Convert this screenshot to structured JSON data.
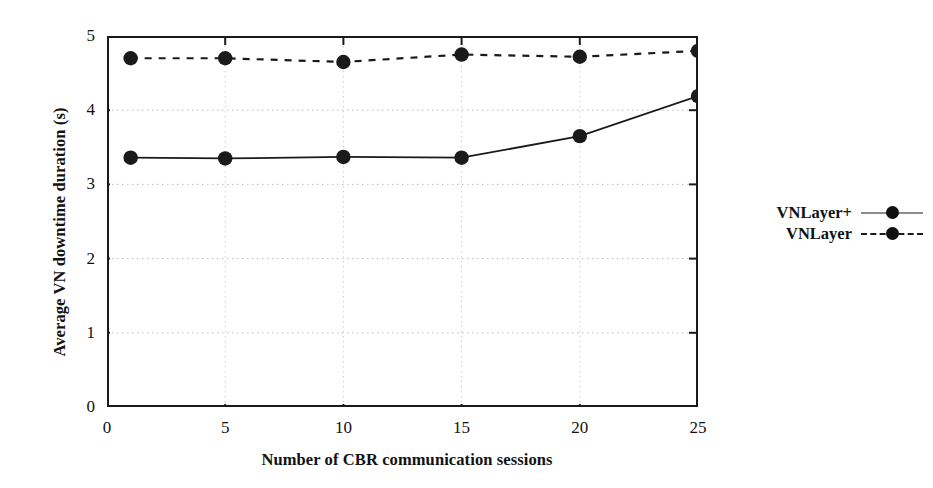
{
  "chart_data": {
    "type": "line",
    "title": "",
    "xlabel": "Number of CBR communication sessions",
    "ylabel": "Average VN downtime duration (s)",
    "x": [
      1,
      5,
      10,
      15,
      20,
      25
    ],
    "xlim": [
      0,
      25
    ],
    "ylim": [
      0,
      5
    ],
    "xticks": [
      0,
      5,
      10,
      15,
      20,
      25
    ],
    "xtick_labels": [
      "0",
      "5",
      "10",
      "15",
      "20",
      "25"
    ],
    "yticks": [
      0,
      1,
      2,
      3,
      4,
      5
    ],
    "ytick_labels": [
      "0",
      "1",
      "2",
      "3",
      "4",
      "5"
    ],
    "grid": true,
    "grid_style": "dotted",
    "legend_position": "right",
    "marker": "filled-circle",
    "series": [
      {
        "name": "VNLayer+",
        "line_style": "solid",
        "color": "#1a1a1a",
        "values": [
          3.36,
          3.35,
          3.37,
          3.36,
          3.65,
          4.19
        ]
      },
      {
        "name": "VNLayer",
        "line_style": "dashed",
        "color": "#1a1a1a",
        "values": [
          4.7,
          4.7,
          4.65,
          4.75,
          4.72,
          4.8
        ]
      }
    ]
  },
  "legend": {
    "items": [
      {
        "label": "VNLayer+",
        "style": "solid"
      },
      {
        "label": "VNLayer",
        "style": "dashed"
      }
    ]
  }
}
